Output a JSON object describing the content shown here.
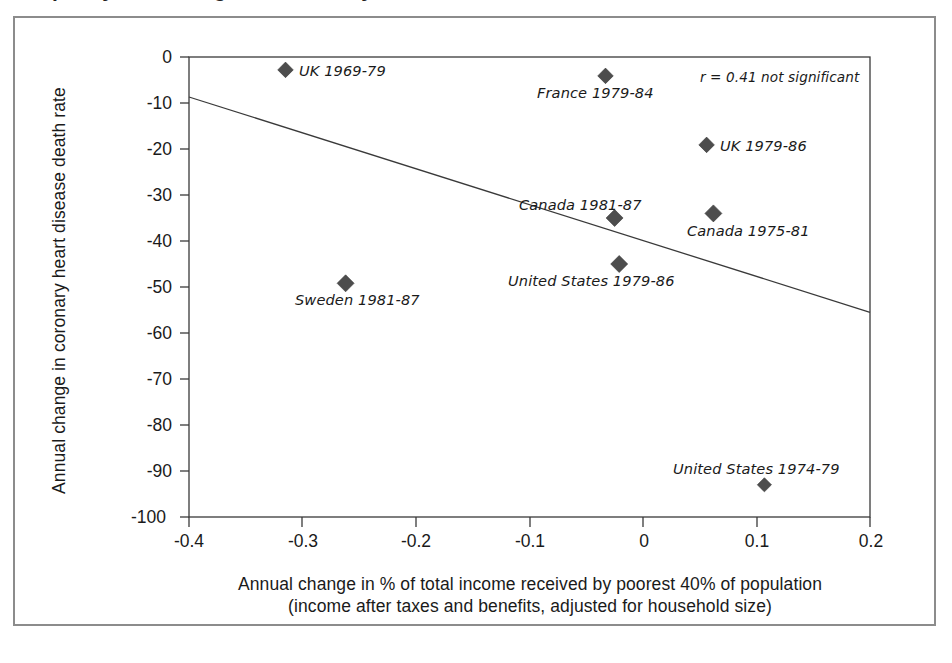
{
  "figure": {
    "title": "Inequality and changes in coronary heart disease death rates",
    "frame_color": "#8c8c8c",
    "background": "#ffffff"
  },
  "chart_data": {
    "type": "scatter",
    "title": "Inequality and changes in coronary heart disease death rates",
    "xlabel_line1": "Annual change in % of total income received by poorest 40% of population",
    "xlabel_line2": "(income after taxes and benefits, adjusted for household size)",
    "ylabel": "Annual change in coronary heart disease death rate",
    "xlim": [
      -0.4,
      0.2
    ],
    "ylim": [
      -100,
      0
    ],
    "xticks": [
      -0.4,
      -0.3,
      -0.2,
      -0.1,
      0,
      0.1,
      0.2
    ],
    "xtick_labels": [
      "-0.4",
      "-0.3",
      "-0.2",
      "-0.1",
      "0",
      "0.1",
      "0.2"
    ],
    "yticks": [
      0,
      -10,
      -20,
      -30,
      -40,
      -50,
      -60,
      -70,
      -80,
      -90,
      -100
    ],
    "ytick_labels": [
      "0",
      "-10",
      "-20",
      "-30",
      "-40",
      "-50",
      "-60",
      "-70",
      "-80",
      "-90",
      "-100"
    ],
    "grid": false,
    "legend": "none",
    "marker_shape": "diamond",
    "marker_color": "#4d4d4d",
    "points": [
      {
        "label": "UK 1969-79",
        "x": -0.315,
        "y": -2.8,
        "label_pos": "right"
      },
      {
        "label": "France 1979-84",
        "x": -0.033,
        "y": -4.1,
        "label_pos": "below"
      },
      {
        "label": "UK 1979-86",
        "x": 0.056,
        "y": -19.1,
        "label_pos": "right"
      },
      {
        "label": "Canada 1981-87",
        "x": -0.025,
        "y": -35.0,
        "label_pos": "above"
      },
      {
        "label": "Canada 1975-81",
        "x": 0.062,
        "y": -34.0,
        "label_pos": "below"
      },
      {
        "label": "United States 1979-86",
        "x": -0.021,
        "y": -45.0,
        "label_pos": "below"
      },
      {
        "label": "Sweden 1981-87",
        "x": -0.262,
        "y": -49.2,
        "label_pos": "below"
      },
      {
        "label": "United States 1974-79",
        "x": 0.107,
        "y": -93.0,
        "label_pos": "above"
      }
    ],
    "trendline": {
      "x0": -0.4,
      "y0": -8.7,
      "x1": 0.2,
      "y1": -55.5
    },
    "annotation": "r = 0.41 not significant",
    "annotation_r": 0.41,
    "annotation_significance": "not significant"
  },
  "axis": {
    "ylabel": "Annual change in coronary heart disease death rate",
    "xlabel_line1": "Annual change in % of total income received by poorest 40% of population",
    "xlabel_line2": "(income after taxes and benefits, adjusted for household size)"
  }
}
